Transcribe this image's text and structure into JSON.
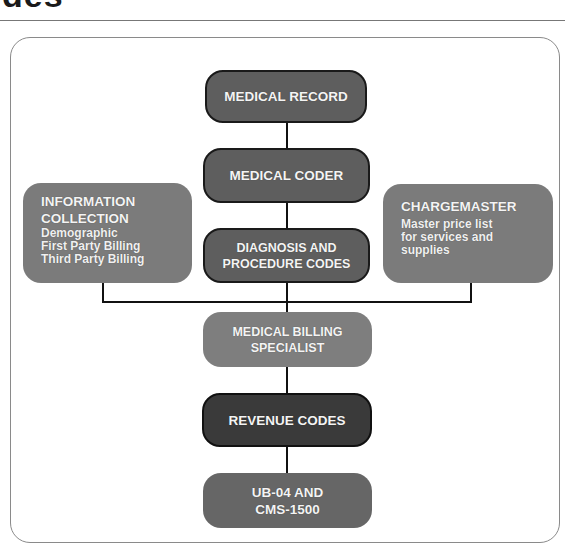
{
  "header": {
    "title_fragment": "des"
  },
  "diagram": {
    "nodes": {
      "medical_record": {
        "title": "MEDICAL RECORD"
      },
      "medical_coder": {
        "title": "MEDICAL CODER"
      },
      "diagnosis_codes": {
        "line1": "DIAGNOSIS AND",
        "line2": "PROCEDURE CODES"
      },
      "information_collection": {
        "line1": "INFORMATION",
        "line2": "COLLECTION",
        "items": [
          "Demographic",
          "First Party Billing",
          "Third Party Billing"
        ]
      },
      "chargemaster": {
        "title": "CHARGEMASTER",
        "desc": [
          "Master price list",
          "for services and",
          "supplies"
        ]
      },
      "billing_specialist": {
        "line1": "MEDICAL BILLING",
        "line2": "SPECIALIST"
      },
      "revenue_codes": {
        "title": "REVENUE CODES"
      },
      "claim_forms": {
        "line1": "UB-04 AND",
        "line2": "CMS-1500"
      }
    },
    "colors": {
      "node_dark": "#5e5e5e",
      "node_darker": "#3a3a3a",
      "node_mid": "#7e7e7e",
      "connector": "#111111",
      "frame_border": "#8a8a8a"
    }
  }
}
